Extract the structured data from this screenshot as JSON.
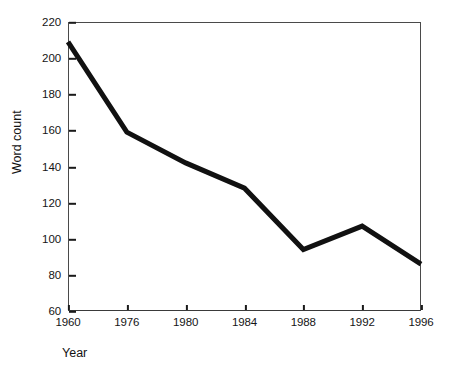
{
  "chart_data": {
    "type": "line",
    "title": "",
    "subtitle": "",
    "xlabel": "Year",
    "ylabel": "Word count",
    "categories": [
      "1960",
      "1976",
      "1980",
      "1984",
      "1988",
      "1992",
      "1996"
    ],
    "x": [
      1960,
      1976,
      1980,
      1984,
      1988,
      1992,
      1996
    ],
    "values": [
      209,
      159,
      142,
      128,
      94,
      107,
      86
    ],
    "series": [
      {
        "name": "Word count",
        "values": [
          209,
          159,
          142,
          128,
          94,
          107,
          86
        ]
      }
    ],
    "xtick_labels": [
      "1960",
      "1976",
      "1980",
      "1984",
      "1988",
      "1992",
      "1996"
    ],
    "ytick_labels": [
      "60",
      "80",
      "100",
      "120",
      "140",
      "160",
      "180",
      "200",
      "220"
    ],
    "ytick_values": [
      60,
      80,
      100,
      120,
      140,
      160,
      180,
      200,
      220
    ],
    "ylim": [
      60,
      220
    ],
    "grid": false,
    "legend": false,
    "legend_position": "none",
    "line_color": "#111111",
    "line_width": 5,
    "background_color": "#ffffff",
    "axis_color": "#3f3f3f"
  }
}
